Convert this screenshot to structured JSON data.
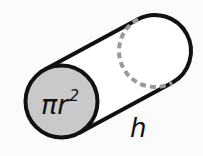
{
  "diagram": {
    "base_area_label": {
      "symbol": "π",
      "variable": "r",
      "exponent": "2"
    },
    "height_label": "h",
    "colors": {
      "background": "#fbfbfb",
      "outline": "#111111",
      "base_fill": "#c9c9c9",
      "hidden_edge": "#9a9a9a"
    }
  }
}
